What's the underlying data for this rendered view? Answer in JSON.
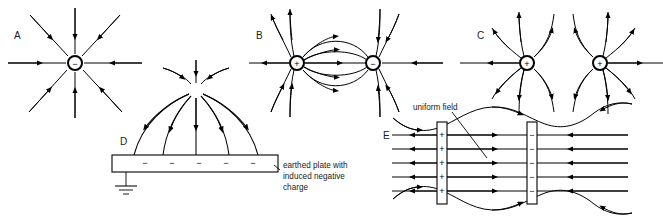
{
  "figure": {
    "background_color": "#ffffff",
    "line_color": "#000000",
    "width": 663,
    "height": 217
  },
  "panels": [
    {
      "id": "A",
      "label": "A",
      "kind": "single-negative-point-charge",
      "charges": [
        {
          "sign": "−",
          "x": 75,
          "y": 63
        }
      ],
      "field_line_count": 8,
      "field_direction": "inward"
    },
    {
      "id": "B",
      "label": "B",
      "kind": "electric-dipole",
      "charges": [
        {
          "sign": "+",
          "x": 297,
          "y": 63
        },
        {
          "sign": "−",
          "x": 373,
          "y": 63
        }
      ],
      "inner_line_count": 5,
      "field_direction": "positive-to-negative"
    },
    {
      "id": "C",
      "label": "C",
      "kind": "two-like-positive-charges",
      "charges": [
        {
          "sign": "+",
          "x": 527,
          "y": 63
        },
        {
          "sign": "+",
          "x": 600,
          "y": 63
        }
      ],
      "field_direction": "outward-repelling"
    },
    {
      "id": "D",
      "label": "D",
      "kind": "point-charge-above-earthed-plate",
      "charges": [
        {
          "sign": "+",
          "x": 196,
          "y": 90
        }
      ],
      "plate_signs": [
        "−",
        "−",
        "−",
        "−",
        "−"
      ],
      "grounded": true,
      "caption_lines": [
        "earthed plate with",
        "induced negative",
        "charge"
      ]
    },
    {
      "id": "E",
      "label": "E",
      "kind": "parallel-plate-capacitor",
      "annotation": "uniform field",
      "left_plate_signs": [
        "+",
        "+",
        "+",
        "+",
        "+"
      ],
      "right_plate_signs": [
        "−",
        "−",
        "−",
        "−",
        "−"
      ],
      "uniform_line_count": 5,
      "fringe_lines": 2,
      "field_direction": "left-plate-to-right-plate"
    }
  ]
}
